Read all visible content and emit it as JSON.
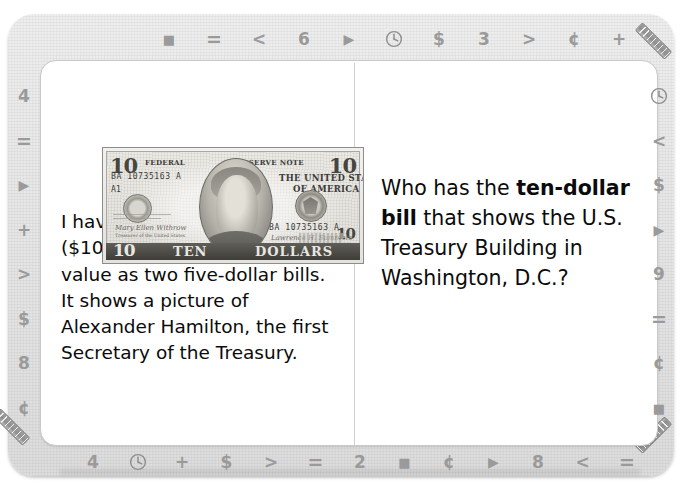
{
  "tab": {
    "label": "Money Card"
  },
  "card": {
    "left_panel": {
      "bill_image": {
        "alt": "ten-dollar-bill",
        "denomination_corner_top_left": "10",
        "denomination_corner_top_right": "10",
        "denomination_corner_bottom_left": "10",
        "denomination_corner_bottom_right": "10",
        "federal_text": "FEDERAL",
        "reserve_note_text": "RESERVE NOTE",
        "country_line_1": "THE UNITED STATES",
        "country_line_2": "OF AMERICA",
        "serial_top": "BA 10735163 A",
        "serial_bottom": "BA 10735163 A",
        "plate_code": "A1",
        "word_ten": "TEN",
        "word_dollars": "DOLLARS",
        "signature_left": "Mary Ellen Withrow",
        "signature_left_title": "Treasurer of the United States",
        "signature_right": "Lawrence H. Summers",
        "signature_right_title": "Secretary of the Treasury"
      },
      "paragraph": {
        "part_1": "I have the ",
        "bold_1": "ten-dollar bill",
        "part_2": " ($10.00), which has the same value as two five-dollar bills. It shows a picture of Alexander Hamilton, the first Secretary of the Treasury."
      }
    },
    "right_panel": {
      "question": {
        "part_1": "Who has the ",
        "bold_1": "ten-dollar bill",
        "part_2": " that shows the U.S. Treasury Building in Washington, D.C.?"
      }
    }
  },
  "borders": {
    "top_icons": [
      "square",
      "equals",
      "less-than",
      "6",
      "triangle",
      "clock",
      "dollar",
      "3",
      "greater-than",
      "cent",
      "plus"
    ],
    "left_icons": [
      "4",
      "equals",
      "triangle",
      "plus",
      "greater-than",
      "dollar",
      "8",
      "cent"
    ],
    "right_icons": [
      "clock",
      "less-than",
      "dollar",
      "triangle",
      "9",
      "equals",
      "cent",
      "square"
    ],
    "bottom_icons": [
      "4",
      "clock",
      "plus",
      "dollar",
      "greater-than",
      "equals",
      "2",
      "square",
      "cent",
      "triangle",
      "8",
      "less-than",
      "equals"
    ],
    "corner_icon": "ruler"
  },
  "glyphs": {
    "square": "■",
    "equals": "=",
    "less-than": "<",
    "greater-than": ">",
    "triangle": "▶",
    "dollar": "$",
    "cent": "¢",
    "plus": "+",
    "2": "2",
    "3": "3",
    "4": "4",
    "6": "6",
    "8": "8",
    "9": "9"
  },
  "colors": {
    "frame": "#e6e6e6",
    "page": "#ffffff",
    "icon": "#9a9a9a",
    "text": "#0b0b0b",
    "divider": "#cfcfcf"
  }
}
